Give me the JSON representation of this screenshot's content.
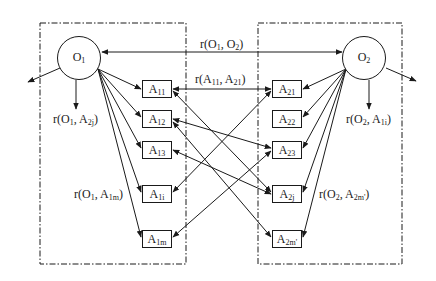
{
  "diagram": {
    "colors": {
      "stroke": "#1a1a1a",
      "background": "#ffffff"
    },
    "groups": [
      {
        "id": "left-group",
        "style": "dash-dot"
      },
      {
        "id": "right-group",
        "style": "dash-dot"
      }
    ],
    "nodes": {
      "O1": {
        "main": "O",
        "sub": "1"
      },
      "O2": {
        "main": "O",
        "sub": "2"
      }
    },
    "left_attributes": [
      {
        "main": "A",
        "sub": "11"
      },
      {
        "main": "A",
        "sub": "12"
      },
      {
        "main": "A",
        "sub": "13"
      },
      {
        "main": "A",
        "sub": "1i"
      },
      {
        "main": "A",
        "sub": "1m"
      }
    ],
    "right_attributes": [
      {
        "main": "A",
        "sub": "21"
      },
      {
        "main": "A",
        "sub": "22"
      },
      {
        "main": "A",
        "sub": "23"
      },
      {
        "main": "A",
        "sub": "2j"
      },
      {
        "main": "A",
        "sub": "2m'"
      }
    ],
    "labels": {
      "r_o1_o2": {
        "p1": "r(O",
        "s1": "1",
        "p2": ", O",
        "s2": "2",
        "p3": ")"
      },
      "r_a11_a21": {
        "p1": "r(A",
        "s1": "11",
        "p2": ", A",
        "s2": "21",
        "p3": ")"
      },
      "r_o1_a2j": {
        "p1": "r(O",
        "s1": "1",
        "p2": ", A",
        "s2": "2j",
        "p3": ")"
      },
      "r_o2_a1i": {
        "p1": "r(O",
        "s1": "2",
        "p2": ", A",
        "s2": "1i",
        "p3": ")"
      },
      "r_o1_a1m": {
        "p1": "r(O",
        "s1": "1",
        "p2": ", A",
        "s2": "1m",
        "p3": ")"
      },
      "r_o2_a2m": {
        "p1": "r(O",
        "s1": "2",
        "p2": ", A",
        "s2": "2m'",
        "p3": ")"
      }
    },
    "edges": [
      {
        "from": "O1",
        "to": "O2",
        "type": "bidirectional"
      },
      {
        "from": "A11",
        "to": "A21",
        "type": "bidirectional"
      },
      {
        "from": "A11",
        "to": "A2j",
        "type": "bidirectional"
      },
      {
        "from": "A12",
        "to": "A23",
        "type": "bidirectional"
      },
      {
        "from": "A12",
        "to": "A2m'",
        "type": "bidirectional"
      },
      {
        "from": "A13",
        "to": "A2j",
        "type": "bidirectional"
      },
      {
        "from": "A1i",
        "to": "A21",
        "type": "bidirectional"
      },
      {
        "from": "A1m",
        "to": "A23",
        "type": "bidirectional"
      },
      {
        "from": "O1",
        "to": "A11",
        "type": "directed"
      },
      {
        "from": "O1",
        "to": "A12",
        "type": "directed"
      },
      {
        "from": "O1",
        "to": "A13",
        "type": "directed"
      },
      {
        "from": "O1",
        "to": "A1i",
        "type": "directed"
      },
      {
        "from": "O1",
        "to": "A1m",
        "type": "directed"
      },
      {
        "from": "O2",
        "to": "A21",
        "type": "directed"
      },
      {
        "from": "O2",
        "to": "A22",
        "type": "directed"
      },
      {
        "from": "O2",
        "to": "A23",
        "type": "directed"
      },
      {
        "from": "O2",
        "to": "A2j",
        "type": "directed"
      },
      {
        "from": "O2",
        "to": "A2m'",
        "type": "directed"
      }
    ]
  }
}
